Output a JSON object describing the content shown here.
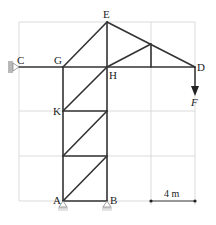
{
  "diagram": {
    "type": "truss-structure",
    "colors": {
      "member": "#333333",
      "grid": "#cfcfcf",
      "support": "#a8a8a8",
      "text": "#222222"
    },
    "nodes": {
      "A": {
        "label": "A",
        "x": 63,
        "y": 201
      },
      "B": {
        "label": "B",
        "x": 107,
        "y": 201
      },
      "C": {
        "label": "C",
        "x": 19,
        "y": 67
      },
      "D": {
        "label": "D",
        "x": 195,
        "y": 67
      },
      "E": {
        "label": "E",
        "x": 107,
        "y": 22
      },
      "G": {
        "label": "G",
        "x": 63,
        "y": 67
      },
      "H": {
        "label": "H",
        "x": 107,
        "y": 67
      },
      "K": {
        "label": "K",
        "x": 63,
        "y": 111
      }
    },
    "load": {
      "label": "F",
      "at": "D",
      "direction": "down"
    },
    "dimension": {
      "label": "4 m"
    },
    "supports": [
      "C (wall, left)",
      "A (pin)",
      "B (pin)"
    ]
  }
}
